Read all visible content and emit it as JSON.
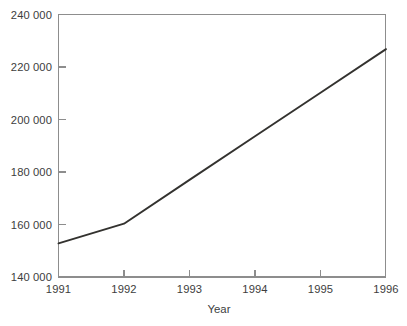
{
  "chart_data": {
    "type": "line",
    "title": "",
    "subtitle": "",
    "xlabel": "Year",
    "ylabel": "",
    "x": [
      1991,
      1992,
      1993,
      1994,
      1995,
      1996
    ],
    "categories": [
      "1991",
      "1992",
      "1993",
      "1994",
      "1995",
      "1996"
    ],
    "series": [
      {
        "name": "",
        "values": [
          152800,
          160300,
          177000,
          193600,
          210200,
          226800
        ]
      }
    ],
    "values": [
      152800,
      160300,
      177000,
      193600,
      210200,
      226800
    ],
    "xlim": [
      1991,
      1996
    ],
    "ylim": [
      140000,
      240000
    ],
    "grid": false,
    "legend": null,
    "legend_position": "none",
    "annotations": []
  },
  "axes": {
    "x_axis": {
      "title": "Year",
      "tick_labels": [
        "1991",
        "1992",
        "1993",
        "1994",
        "1995",
        "1996"
      ],
      "tick_values": [
        1991,
        1992,
        1993,
        1994,
        1995,
        1996
      ],
      "tick_direction": "in"
    },
    "y_axis": {
      "title": "",
      "tick_labels": [
        "140 000",
        "160 000",
        "180 000",
        "200 000",
        "220 000",
        "240 000"
      ],
      "tick_values": [
        140000,
        160000,
        180000,
        200000,
        220000,
        240000
      ],
      "tick_direction": "in"
    }
  },
  "style": {
    "background_color": "#ffffff",
    "frame_color": "#8d8d8d",
    "line_color": "#33322f",
    "text_color": "#3d3d3d"
  }
}
